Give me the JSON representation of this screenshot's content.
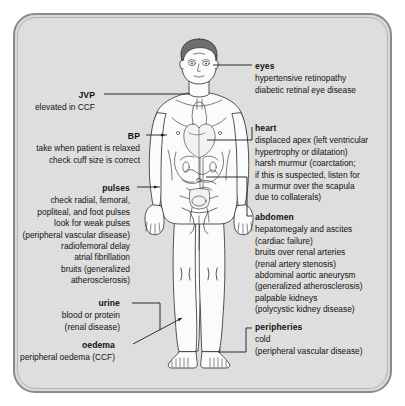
{
  "diagram": {
    "figure_name": "anatomical-male-figure",
    "frame_color": "#8b8b8b",
    "background_color": "#dedede",
    "text_color": "#121212",
    "leader_line_color": "#1a1a1a"
  },
  "callouts_right": [
    {
      "id": "eyes",
      "heading": "eyes",
      "lines": [
        "hypertensive retinopathy",
        "diabetic retinal eye disease"
      ]
    },
    {
      "id": "heart",
      "heading": "heart",
      "lines": [
        "displaced apex (left ventricular",
        "hypertrophy or dilatation)",
        "harsh murmur (coarctation;",
        "if this is suspected, listen for",
        "a murmur over the scapula",
        "due to collaterals)"
      ]
    },
    {
      "id": "abdomen",
      "heading": "abdomen",
      "lines": [
        "hepatomegaly and ascites",
        "(cardiac failure)",
        "bruits over renal arteries",
        "(renal artery stenosis)",
        "abdominal aortic aneurysm",
        "(generalized atherosclerosis)",
        "palpable kidneys",
        "(polycystic kidney disease)"
      ]
    },
    {
      "id": "peripheries",
      "heading": "peripheries",
      "lines": [
        "cold",
        "(peripheral vascular disease)"
      ]
    }
  ],
  "callouts_left": [
    {
      "id": "jvp",
      "heading": "JVP",
      "lines": [
        "elevated in CCF"
      ]
    },
    {
      "id": "bp",
      "heading": "BP",
      "lines": [
        "take when patient is relaxed",
        "check cuff size is correct"
      ]
    },
    {
      "id": "pulses",
      "heading": "pulses",
      "lines": [
        "check radial, femoral,",
        "popliteal, and foot pulses",
        "look for weak pulses",
        "(peripheral vascular disease)",
        "radiofemoral delay",
        "atrial fibrillation",
        "bruits (generalized",
        "atherosclerosis)"
      ]
    },
    {
      "id": "urine",
      "heading": "urine",
      "lines": [
        "blood or protein",
        "(renal disease)"
      ]
    },
    {
      "id": "oedema",
      "heading": "oedema",
      "lines": [
        "peripheral oedema (CCF)"
      ]
    }
  ]
}
